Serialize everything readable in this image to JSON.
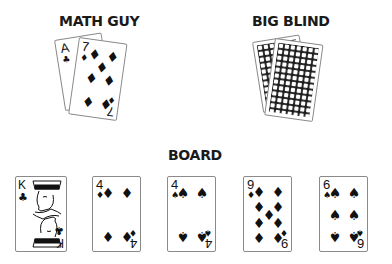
{
  "players": [
    {
      "name": "MATH GUY",
      "cards": [
        {
          "rank": "A",
          "suit": "♣",
          "suit_name": "clubs",
          "face_up": true
        },
        {
          "rank": "7",
          "suit": "♦",
          "suit_name": "diamonds",
          "face_up": true
        }
      ]
    },
    {
      "name": "BIG BLIND",
      "cards": [
        {
          "face_up": false
        },
        {
          "face_up": false
        }
      ]
    }
  ],
  "board": {
    "label": "BOARD",
    "cards": [
      {
        "rank": "K",
        "suit": "♣",
        "suit_name": "clubs"
      },
      {
        "rank": "4",
        "suit": "♦",
        "suit_name": "diamonds"
      },
      {
        "rank": "4",
        "suit": "♠",
        "suit_name": "spades"
      },
      {
        "rank": "9",
        "suit": "♦",
        "suit_name": "diamonds"
      },
      {
        "rank": "6",
        "suit": "♠",
        "suit_name": "spades"
      }
    ]
  }
}
